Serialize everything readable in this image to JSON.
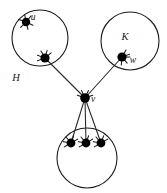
{
  "figure": {
    "type": "graph-diagram",
    "title": "",
    "background_color": "#ffffff",
    "stroke_color": "#1c1c1c",
    "node_color": "#000000",
    "width": 167,
    "height": 193
  },
  "regions": [
    {
      "id": "H",
      "label": "H",
      "label_x": 16,
      "label_y": 81,
      "cx": 40,
      "cy": 38,
      "r": 28
    },
    {
      "id": "K",
      "label": "K",
      "label_x": 125,
      "label_y": 40,
      "cx": 130,
      "cy": 41,
      "r": 29
    },
    {
      "id": "bottom",
      "label": "",
      "label_x": 0,
      "label_y": 0,
      "cx": 87,
      "cy": 158,
      "r": 30
    }
  ],
  "nodes": [
    {
      "id": "u",
      "label": "u",
      "x": 26,
      "y": 22,
      "r": 4.2,
      "label_x": 33,
      "label_y": 20,
      "region": "H",
      "whiskers": [
        25,
        75,
        135,
        200,
        260,
        310
      ]
    },
    {
      "id": "h2",
      "label": "",
      "x": 45,
      "y": 58,
      "r": 4.6,
      "label_x": 0,
      "label_y": 0,
      "region": "H",
      "whiskers": [
        160,
        200,
        240,
        285,
        320
      ]
    },
    {
      "id": "w",
      "label": "w",
      "x": 122,
      "y": 57,
      "r": 4.6,
      "label_x": 133,
      "label_y": 63,
      "region": "K",
      "whiskers": [
        0,
        50,
        95,
        300,
        340
      ]
    },
    {
      "id": "v",
      "label": "v",
      "x": 85,
      "y": 98,
      "r": 4.8,
      "label_x": 93,
      "label_y": 102,
      "region": "",
      "whiskers": [
        200,
        245,
        295,
        340
      ]
    },
    {
      "id": "b1",
      "label": "",
      "x": 71,
      "y": 143,
      "r": 4.4,
      "label_x": 0,
      "label_y": 0,
      "region": "bottom",
      "whiskers": [
        150,
        190,
        230,
        290,
        330
      ]
    },
    {
      "id": "b2",
      "label": "",
      "x": 86,
      "y": 143,
      "r": 4.4,
      "label_x": 0,
      "label_y": 0,
      "region": "bottom",
      "whiskers": [
        150,
        190,
        230,
        290,
        330
      ]
    },
    {
      "id": "b3",
      "label": "",
      "x": 101,
      "y": 143,
      "r": 4.4,
      "label_x": 0,
      "label_y": 0,
      "region": "bottom",
      "whiskers": [
        150,
        190,
        230,
        290,
        330
      ]
    }
  ],
  "edges": [
    {
      "from": "h2",
      "to": "v"
    },
    {
      "from": "w",
      "to": "v"
    },
    {
      "from": "v",
      "to": "b1"
    },
    {
      "from": "v",
      "to": "b2"
    },
    {
      "from": "v",
      "to": "b3"
    }
  ]
}
